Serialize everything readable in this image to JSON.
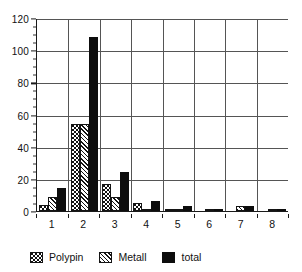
{
  "chart_data": {
    "type": "bar",
    "title": "",
    "xlabel": "",
    "ylabel": "",
    "ylim": [
      0,
      120
    ],
    "ytick_step": 20,
    "yticks": [
      0,
      20,
      40,
      60,
      80,
      100,
      120
    ],
    "minor_tick_step": 5,
    "grid": "horizontal-and-vertical",
    "legend_position": "bottom",
    "categories": [
      "1",
      "2",
      "3",
      "4",
      "5",
      "6",
      "7",
      "8"
    ],
    "series": [
      {
        "name": "Polypin",
        "pattern": "dotted-checker",
        "values": [
          4,
          54,
          17,
          5,
          1,
          0,
          0,
          0
        ]
      },
      {
        "name": "Metall",
        "pattern": "diagonal-hatch",
        "values": [
          9,
          54,
          9,
          1,
          1,
          1,
          3,
          1
        ]
      },
      {
        "name": "total",
        "pattern": "solid-black",
        "values": [
          14,
          108,
          24,
          6,
          3,
          1,
          3,
          1
        ]
      }
    ]
  },
  "legend": {
    "items": [
      {
        "label": "Polypin",
        "swatch": "polypin-swatch"
      },
      {
        "label": "Metall",
        "swatch": "metall-swatch"
      },
      {
        "label": "total",
        "swatch": "total-swatch"
      }
    ]
  },
  "colors": {
    "axis": "#1a1a1a",
    "grid": "#555555",
    "total_fill": "#0d0d0d",
    "background": "#ffffff"
  }
}
